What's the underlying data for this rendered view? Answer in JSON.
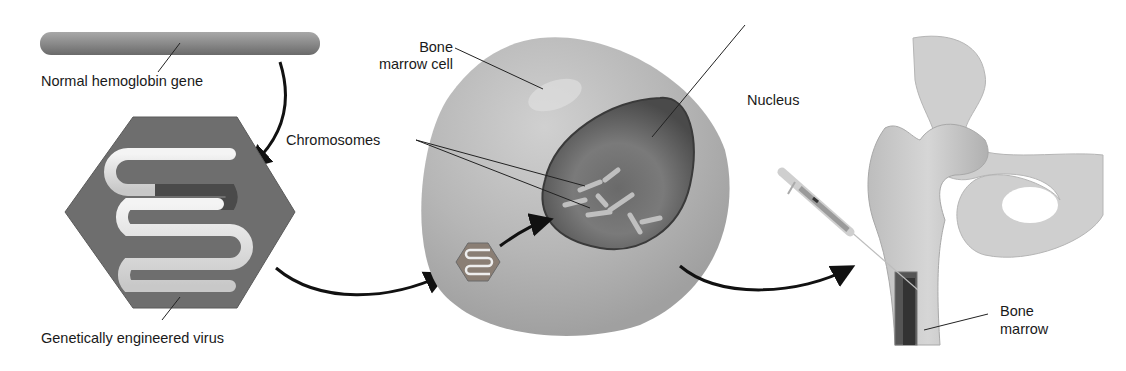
{
  "diagram": {
    "type": "gene therapy process illustration",
    "labels": {
      "gene": "Normal hemoglobin gene",
      "virus": "Genetically engineered virus",
      "cell_line1": "Bone",
      "cell_line2": "marrow cell",
      "chromosomes": "Chromosomes",
      "nucleus": "Nucleus",
      "marrow_line1": "Bone",
      "marrow_line2": "marrow"
    },
    "steps": [
      "Normal hemoglobin gene inserted into virus",
      "Virus enters bone marrow cell nucleus",
      "Modified cells injected into bone marrow"
    ],
    "colors": {
      "gene": "#8a8a8a",
      "virus_capsid": "#6e6e6e",
      "dna_strand": "#e6e6e6",
      "cell": "#b8b8b8",
      "nucleus": "#5f5f5f",
      "bone": "#cdcdcd",
      "marrow": "#3e3e3e",
      "arrow": "#111111"
    }
  }
}
